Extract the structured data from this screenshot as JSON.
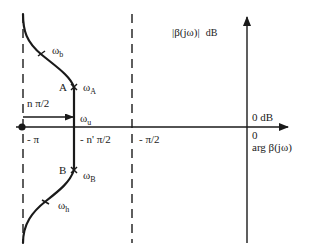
{
  "diagram": {
    "type": "Nichols-style gain/phase sketch",
    "y_axis_label": "|β(jω)|",
    "y_axis_unit": "dB",
    "x_axis_label": "arg β(jω)",
    "origin_gain_label": "0 dB",
    "origin_phase_label": "0",
    "phase_markers": [
      {
        "label": "- π"
      },
      {
        "label": "- n' π/2"
      },
      {
        "label": "- π/2"
      }
    ],
    "span_annotation": "n π/2",
    "points": [
      {
        "name": "A",
        "omega": "ω",
        "omega_sub": "A"
      },
      {
        "name": "B",
        "omega": "ω",
        "omega_sub": "B"
      }
    ],
    "frequency_marks": [
      {
        "omega": "ω",
        "sub": "b"
      },
      {
        "omega": "ω",
        "sub": "u"
      },
      {
        "omega": "ω",
        "sub": "h"
      }
    ]
  }
}
